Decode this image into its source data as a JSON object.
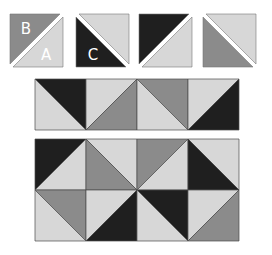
{
  "colors": {
    "dark": "#1f1f1f",
    "medium": "#8b8b8b",
    "light": "#d7d7d7",
    "border": "#4a4a4a",
    "background": "#ffffff"
  },
  "units": [
    {
      "id": "unit-1",
      "x": 10,
      "y": 14,
      "size": 53,
      "diagonal": "bl-tr",
      "first": {
        "fill": "medium",
        "label": "B",
        "pos": "tl"
      },
      "second": {
        "fill": "light",
        "label": "A",
        "pos": "br"
      }
    },
    {
      "id": "unit-2",
      "x": 76,
      "y": 14,
      "size": 53,
      "diagonal": "tl-br",
      "first": {
        "fill": "light",
        "label": "",
        "pos": "tr"
      },
      "second": {
        "fill": "dark",
        "label": "C",
        "pos": "bl"
      }
    },
    {
      "id": "unit-3",
      "x": 139,
      "y": 14,
      "size": 53,
      "diagonal": "bl-tr",
      "first": {
        "fill": "dark",
        "label": "",
        "pos": "tl"
      },
      "second": {
        "fill": "light",
        "label": "",
        "pos": "br"
      }
    },
    {
      "id": "unit-4",
      "x": 203,
      "y": 14,
      "size": 53,
      "diagonal": "tl-br",
      "first": {
        "fill": "light",
        "label": "",
        "pos": "tr"
      },
      "second": {
        "fill": "medium",
        "label": "",
        "pos": "bl"
      }
    }
  ],
  "strip": {
    "x": 35,
    "y": 79,
    "cell": 51,
    "cells": [
      {
        "diagonal": "tl-br",
        "a": "dark",
        "b": "light"
      },
      {
        "diagonal": "bl-tr",
        "a": "light",
        "b": "medium"
      },
      {
        "diagonal": "tl-br",
        "a": "medium",
        "b": "light"
      },
      {
        "diagonal": "bl-tr",
        "a": "light",
        "b": "dark"
      }
    ]
  },
  "grid": {
    "x": 35,
    "y": 139,
    "cell": 51,
    "rows": [
      [
        {
          "diagonal": "bl-tr",
          "a": "dark",
          "b": "light"
        },
        {
          "diagonal": "tl-br",
          "a": "light",
          "b": "medium"
        },
        {
          "diagonal": "bl-tr",
          "a": "medium",
          "b": "light"
        },
        {
          "diagonal": "tl-br",
          "a": "light",
          "b": "dark"
        }
      ],
      [
        {
          "diagonal": "tl-br",
          "a": "medium",
          "b": "light"
        },
        {
          "diagonal": "bl-tr",
          "a": "light",
          "b": "dark"
        },
        {
          "diagonal": "tl-br",
          "a": "dark",
          "b": "light"
        },
        {
          "diagonal": "bl-tr",
          "a": "light",
          "b": "medium"
        }
      ]
    ]
  }
}
